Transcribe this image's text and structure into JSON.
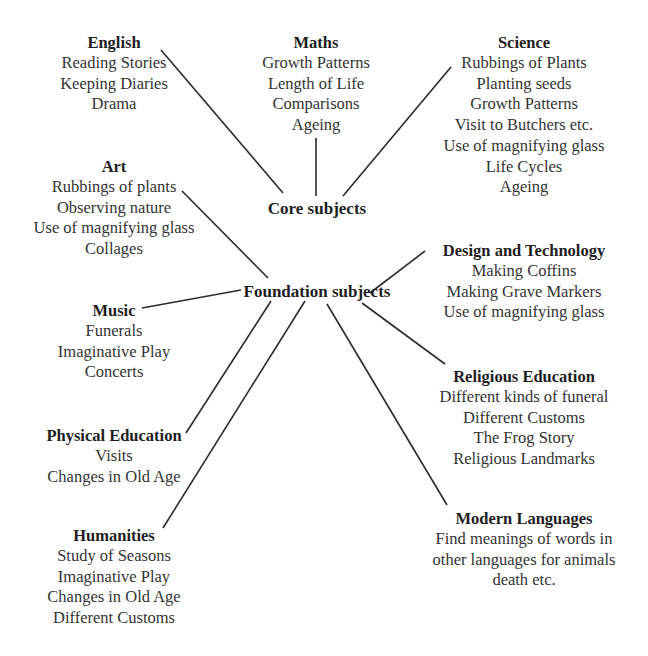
{
  "hubs": {
    "core": {
      "label": "Core subjects",
      "x": 317,
      "y": 209
    },
    "foundation": {
      "label": "Foundation subjects",
      "x": 317,
      "y": 292
    }
  },
  "nodes": [
    {
      "id": "english",
      "title": "English",
      "hub": "core",
      "x": 114,
      "y": 32,
      "items": [
        "Reading Stories",
        "Keeping Diaries",
        "Drama"
      ]
    },
    {
      "id": "maths",
      "title": "Maths",
      "hub": "core",
      "x": 316,
      "y": 32,
      "items": [
        "Growth Patterns",
        "Length of Life",
        "Comparisons",
        "Ageing"
      ]
    },
    {
      "id": "science",
      "title": "Science",
      "hub": "core",
      "x": 524,
      "y": 32,
      "items": [
        "Rubbings of Plants",
        "Planting seeds",
        "Growth Patterns",
        "Visit to Butchers etc.",
        "Use of magnifying glass",
        "Life Cycles",
        "Ageing"
      ]
    },
    {
      "id": "art",
      "title": "Art",
      "hub": "foundation",
      "x": 114,
      "y": 156,
      "items": [
        "Rubbings of plants",
        "Observing nature",
        "Use of magnifying glass",
        "Collages"
      ]
    },
    {
      "id": "music",
      "title": "Music",
      "hub": "foundation",
      "x": 114,
      "y": 300,
      "items": [
        "Funerals",
        "Imaginative Play",
        "Concerts"
      ]
    },
    {
      "id": "physical-education",
      "title": "Physical Education",
      "hub": "foundation",
      "x": 114,
      "y": 425,
      "items": [
        "Visits",
        "Changes in Old Age"
      ]
    },
    {
      "id": "humanities",
      "title": "Humanities",
      "hub": "foundation",
      "x": 114,
      "y": 525,
      "items": [
        "Study of Seasons",
        "Imaginative Play",
        "Changes in Old Age",
        "Different Customs"
      ]
    },
    {
      "id": "design-technology",
      "title": "Design and Technology",
      "hub": "foundation",
      "x": 524,
      "y": 240,
      "items": [
        "Making Coffins",
        "Making Grave Markers",
        "Use of magnifying glass"
      ]
    },
    {
      "id": "religious-education",
      "title": "Religious Education",
      "hub": "foundation",
      "x": 524,
      "y": 366,
      "items": [
        "Different kinds of funeral",
        "Different Customs",
        "The Frog Story",
        "Religious Landmarks"
      ]
    },
    {
      "id": "modern-languages",
      "title": "Modern Languages",
      "hub": "foundation",
      "x": 524,
      "y": 508,
      "items": [
        "Find meanings of words in",
        "other languages for animals",
        "death etc."
      ]
    }
  ],
  "connectors": [
    {
      "from": "english",
      "to": "core",
      "x1": 161,
      "y1": 50,
      "x2": 283,
      "y2": 193
    },
    {
      "from": "maths",
      "to": "core",
      "x1": 316,
      "y1": 138,
      "x2": 316,
      "y2": 196
    },
    {
      "from": "science",
      "to": "core",
      "x1": 451,
      "y1": 67,
      "x2": 343,
      "y2": 196
    },
    {
      "from": "art",
      "to": "foundation",
      "x1": 182,
      "y1": 191,
      "x2": 268,
      "y2": 278
    },
    {
      "from": "music",
      "to": "foundation",
      "x1": 142,
      "y1": 308,
      "x2": 241,
      "y2": 290
    },
    {
      "from": "physical-education",
      "to": "foundation",
      "x1": 186,
      "y1": 433,
      "x2": 271,
      "y2": 301
    },
    {
      "from": "humanities",
      "to": "foundation",
      "x1": 163,
      "y1": 528,
      "x2": 305,
      "y2": 301
    },
    {
      "from": "design-technology",
      "to": "foundation",
      "x1": 370,
      "y1": 293,
      "x2": 425,
      "y2": 251
    },
    {
      "from": "religious-education",
      "to": "foundation",
      "x1": 362,
      "y1": 303,
      "x2": 445,
      "y2": 364
    },
    {
      "from": "modern-languages",
      "to": "foundation",
      "x1": 327,
      "y1": 304,
      "x2": 447,
      "y2": 505
    }
  ]
}
